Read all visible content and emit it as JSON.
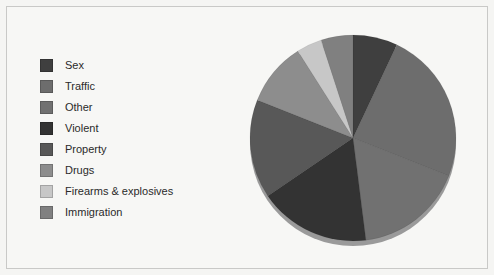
{
  "figure": {
    "background": "#f5f5f3",
    "frame_color": "#c9c9c7"
  },
  "legend": {
    "title": "",
    "position": "left",
    "items": [
      {
        "label": "Sex",
        "color": "#3f3f3f"
      },
      {
        "label": "Traffic",
        "color": "#6d6d6d"
      },
      {
        "label": "Other",
        "color": "#717171"
      },
      {
        "label": "Violent",
        "color": "#333333"
      },
      {
        "label": "Property",
        "color": "#585858"
      },
      {
        "label": "Drugs",
        "color": "#8d8d8d"
      },
      {
        "label": "Firearms & explosives",
        "color": "#c7c7c7"
      },
      {
        "label": "Immigration",
        "color": "#808080"
      }
    ]
  },
  "chart_data": {
    "type": "pie",
    "title": "",
    "xlabel": "",
    "ylabel": "",
    "start_angle_deg": 0,
    "direction": "clockwise",
    "categories": [
      "Sex",
      "Traffic",
      "Other",
      "Violent",
      "Property",
      "Drugs",
      "Firearms & explosives",
      "Immigration"
    ],
    "values": [
      7.0,
      24.0,
      17.0,
      17.5,
      15.5,
      10.0,
      4.0,
      5.0
    ],
    "units": "percent",
    "colors": [
      "#3f3f3f",
      "#6d6d6d",
      "#717171",
      "#333333",
      "#585858",
      "#8d8d8d",
      "#c7c7c7",
      "#808080"
    ],
    "slices": [
      {
        "label": "Sex",
        "value": 7.0,
        "color": "#3f3f3f",
        "start_deg": 0.0,
        "end_deg": 25.2
      },
      {
        "label": "Traffic",
        "value": 24.0,
        "color": "#6d6d6d",
        "start_deg": 25.2,
        "end_deg": 111.6
      },
      {
        "label": "Other",
        "value": 17.0,
        "color": "#717171",
        "start_deg": 111.6,
        "end_deg": 172.8
      },
      {
        "label": "Violent",
        "value": 17.5,
        "color": "#333333",
        "start_deg": 172.8,
        "end_deg": 235.8
      },
      {
        "label": "Property",
        "value": 15.5,
        "color": "#585858",
        "start_deg": 235.8,
        "end_deg": 291.6
      },
      {
        "label": "Drugs",
        "value": 10.0,
        "color": "#8d8d8d",
        "start_deg": 291.6,
        "end_deg": 327.6
      },
      {
        "label": "Firearms & explosives",
        "value": 4.0,
        "color": "#c7c7c7",
        "start_deg": 327.6,
        "end_deg": 342.0
      },
      {
        "label": "Immigration",
        "value": 5.0,
        "color": "#808080",
        "start_deg": 342.0,
        "end_deg": 360.0
      }
    ],
    "geometry": {
      "center_x": 105,
      "center_y": 107,
      "radius": 103,
      "depth": 5,
      "shadow_color": "#9a9a9a"
    },
    "legend": true,
    "grid": false,
    "data_labels": false
  }
}
